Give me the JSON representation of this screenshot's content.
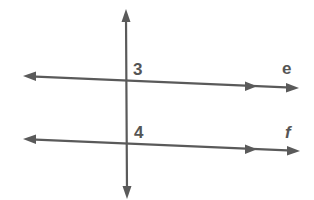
{
  "diagram": {
    "colors": {
      "stroke": "#5a5a5a",
      "label": "#555555",
      "background": "#ffffff"
    },
    "transversal": {
      "x1": 126,
      "y1": 10,
      "x2": 127,
      "y2": 198
    },
    "lines": [
      {
        "name": "e",
        "label": "e",
        "x1": 24,
        "y1": 76,
        "x2": 298,
        "y2": 88,
        "parallel_marker_x": 256
      },
      {
        "name": "f",
        "label": "f",
        "x1": 24,
        "y1": 139,
        "x2": 299,
        "y2": 151,
        "parallel_marker_x": 256
      }
    ],
    "angle_labels": [
      {
        "label": "3",
        "x": 133,
        "y": 75
      },
      {
        "label": "4",
        "x": 134,
        "y": 138
      }
    ],
    "line_labels": [
      {
        "label": "e",
        "x": 282,
        "y": 74
      },
      {
        "label": "f",
        "x": 285,
        "y": 138
      }
    ]
  }
}
